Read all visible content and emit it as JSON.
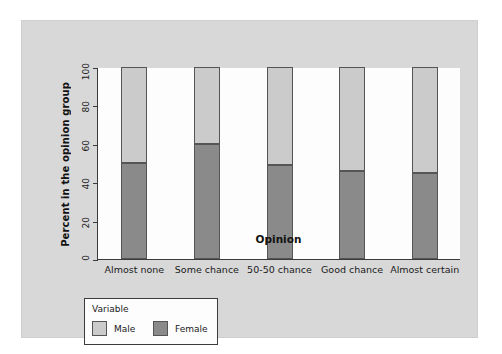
{
  "chart_data": {
    "type": "bar",
    "subtype": "stacked-100-percent",
    "title": "",
    "xlabel": "Opinion",
    "ylabel": "Percent in the opinion group",
    "categories": [
      "Almost none",
      "Some chance",
      "50-50 chance",
      "Good chance",
      "Almost certain"
    ],
    "series": [
      {
        "name": "Female",
        "values": [
          50,
          60,
          49,
          46,
          45
        ],
        "color": "#8a8a8a"
      },
      {
        "name": "Male",
        "values": [
          50,
          40,
          51,
          54,
          55
        ],
        "color": "#cbcbcb"
      }
    ],
    "stack_order_bottom_to_top": [
      "Female",
      "Male"
    ],
    "ylim": [
      0,
      100
    ],
    "yticks": [
      0,
      20,
      40,
      60,
      80,
      100
    ],
    "ytick_labels": [
      "0",
      "20",
      "40",
      "60",
      "80",
      "100"
    ],
    "grid": false,
    "legend_position": "below-axes-left"
  },
  "legend": {
    "title": "Variable",
    "entries": [
      {
        "label": "Male",
        "color": "#cbcbcb"
      },
      {
        "label": "Female",
        "color": "#8a8a8a"
      }
    ]
  },
  "colors": {
    "male": "#cbcbcb",
    "female": "#8a8a8a",
    "panel_background": "#d8d8d8",
    "plot_background": "#fdfdfd",
    "axis": "#3b3b3b"
  }
}
